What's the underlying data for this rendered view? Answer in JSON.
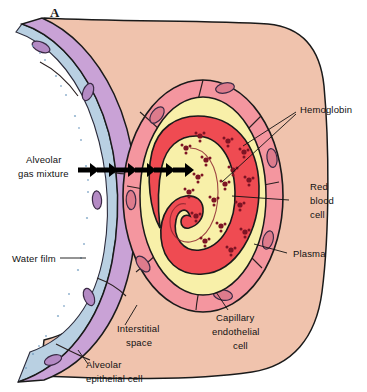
{
  "figure": {
    "panel_letter": "A",
    "alt_description": "Cross-section of the alveolar-capillary (respiratory) membrane showing oxygen diffusion from alveolar gas into a red blood cell"
  },
  "labels": {
    "alveolar_gas_mixture": [
      "Alveolar",
      "gas mixture"
    ],
    "water_film": [
      "Water film"
    ],
    "alveolar_epithelial_cell": [
      "Alveolar",
      "epithelial cell"
    ],
    "interstitial_space": [
      "Interstitial",
      "space"
    ],
    "capillary_endothelial_cell": [
      "Capillary",
      "endothelial",
      "cell"
    ],
    "plasma": [
      "Plasma"
    ],
    "red_blood_cell": [
      "Red",
      "blood",
      "cell"
    ],
    "hemoglobin": [
      "Hemoglobin"
    ]
  },
  "colors": {
    "background": "#ffffff",
    "interstitial_space": "#f0c3ad",
    "alveolar_epithelium_purple": "#c9a2d6",
    "water_film_blue": "#b9d0e2",
    "capillary_endothelium_pink": "#f4969f",
    "plasma_yellow": "#f8f0a9",
    "red_blood_cell": "#ef4b52",
    "hemoglobin_dot": "#7d1424",
    "outline": "#1a1a1a",
    "text": "#111111"
  },
  "diffusion_arrows": {
    "count": 6,
    "direction": "left-to-right",
    "x_positions": [
      82,
      101,
      120,
      139,
      158,
      177
    ],
    "y": 170
  },
  "hemoglobin_dots": {
    "count": 17,
    "points": [
      [
        200,
        136
      ],
      [
        228,
        141
      ],
      [
        186,
        148
      ],
      [
        244,
        152
      ],
      [
        206,
        160
      ],
      [
        233,
        170
      ],
      [
        198,
        177
      ],
      [
        225,
        184
      ],
      [
        249,
        180
      ],
      [
        189,
        192
      ],
      [
        214,
        200
      ],
      [
        240,
        205
      ],
      [
        196,
        216
      ],
      [
        221,
        226
      ],
      [
        245,
        232
      ],
      [
        205,
        241
      ],
      [
        231,
        250
      ]
    ]
  },
  "layers": [
    "alveolar gas space",
    "water film",
    "alveolar epithelial cell",
    "interstitial space",
    "capillary endothelial cell",
    "plasma",
    "red blood cell"
  ]
}
